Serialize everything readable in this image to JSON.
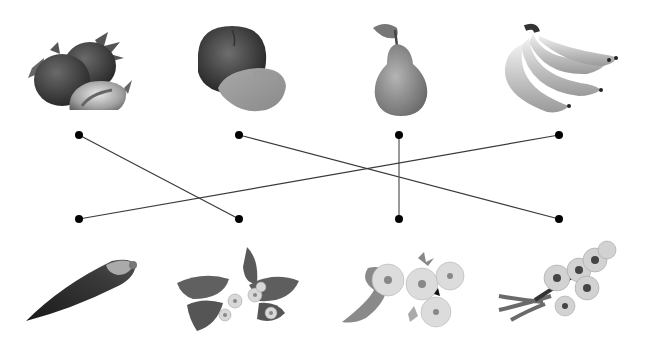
{
  "diagram": {
    "type": "matching-exercise",
    "colors": {
      "background": "#ffffff",
      "line": "#3a3a3a",
      "dot": "#000000"
    },
    "top_row": [
      {
        "id": "strawberry",
        "label": "Strawberry fruit",
        "dot": [
          79,
          135
        ]
      },
      {
        "id": "peach",
        "label": "Peach fruit",
        "dot": [
          239,
          135
        ]
      },
      {
        "id": "pear",
        "label": "Pear fruit",
        "dot": [
          399,
          135
        ]
      },
      {
        "id": "banana",
        "label": "Banana fruit",
        "dot": [
          559,
          135
        ]
      }
    ],
    "bottom_row": [
      {
        "id": "banana-flower",
        "label": "Banana flower bud",
        "dot": [
          79,
          219
        ]
      },
      {
        "id": "strawberry-flower",
        "label": "Strawberry flowers and leaves",
        "dot": [
          239,
          219
        ]
      },
      {
        "id": "pear-blossom",
        "label": "Pear blossoms",
        "dot": [
          399,
          219
        ]
      },
      {
        "id": "peach-blossom",
        "label": "Peach blossom branch",
        "dot": [
          559,
          219
        ]
      }
    ],
    "connections": [
      {
        "from": "strawberry",
        "to": "strawberry-flower"
      },
      {
        "from": "peach",
        "to": "peach-blossom"
      },
      {
        "from": "pear",
        "to": "pear-blossom"
      },
      {
        "from": "banana",
        "to": "banana-flower"
      }
    ]
  }
}
